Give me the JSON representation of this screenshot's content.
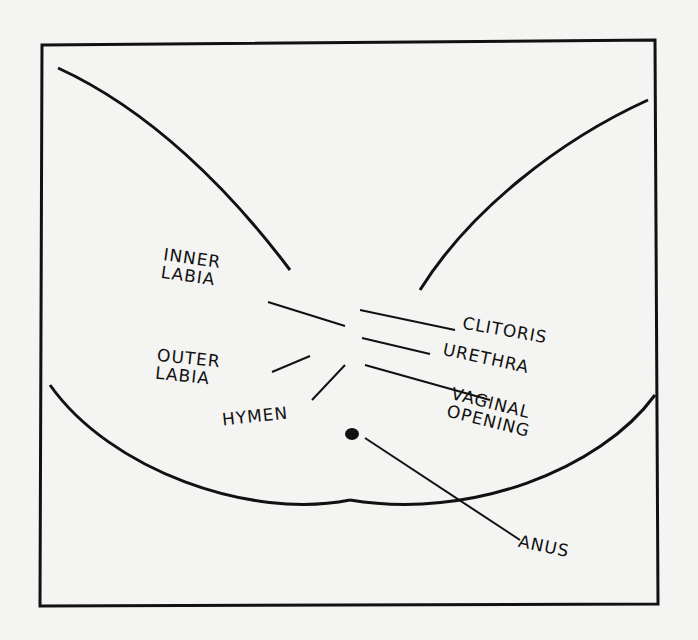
{
  "diagram": {
    "type": "labeled anatomical line drawing",
    "labels": {
      "inner_labia": "INNER\nLABIA",
      "outer_labia": "OUTER\nLABIA",
      "hymen": "HYMEN",
      "clitoris": "CLITORIS",
      "urethra": "URETHRA",
      "vaginal_opening": "VAGINAL\nOPENING",
      "anus": "ANUS"
    },
    "colors": {
      "ink": "#111111",
      "paper": "#f4f4f2"
    }
  }
}
